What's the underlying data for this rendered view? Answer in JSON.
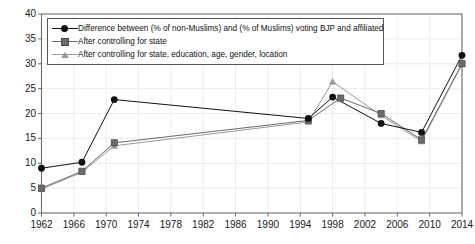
{
  "chart_data": {
    "type": "line",
    "title": "",
    "xlabel": "",
    "ylabel": "",
    "xlim": [
      1962,
      2014
    ],
    "ylim": [
      0,
      40
    ],
    "ytick_step": 5,
    "xtick_step": 4,
    "grid": true,
    "legend_position": "top-left",
    "yticks": [
      "0",
      "5",
      "10",
      "15",
      "20",
      "25",
      "30",
      "35",
      "40"
    ],
    "xticks": [
      "1962",
      "1966",
      "1970",
      "1974",
      "1978",
      "1982",
      "1986",
      "1990",
      "1994",
      "1998",
      "2002",
      "2006",
      "2010",
      "2014"
    ],
    "x": [
      1962,
      1967,
      1971,
      1995,
      1998,
      1999,
      2004,
      2009,
      2014
    ],
    "series": [
      {
        "name": "Difference between (% of non-Muslims) and (% of Muslims) voting BJP and affiliated",
        "marker": "circle",
        "color": "#111111",
        "x": [
          1962,
          1967,
          1971,
          1995,
          1998,
          2004,
          2009,
          2014
        ],
        "values": [
          9.0,
          10.2,
          22.8,
          19.0,
          23.3,
          18.0,
          16.2,
          31.7
        ]
      },
      {
        "name": "After controlling for state",
        "marker": "square",
        "color": "#6b6b6b",
        "x": [
          1962,
          1967,
          1971,
          1995,
          1999,
          2004,
          2009,
          2014
        ],
        "values": [
          5.0,
          8.4,
          14.1,
          18.6,
          23.1,
          20.0,
          14.7,
          30.0
        ]
      },
      {
        "name": "After controlling for state, education, age, gender, location",
        "marker": "triangle",
        "color": "#9a9a9a",
        "x": [
          1962,
          1967,
          1971,
          1995,
          1998,
          2004,
          2009,
          2014
        ],
        "values": [
          4.8,
          8.2,
          13.5,
          18.3,
          26.4,
          19.6,
          14.4,
          29.9
        ]
      }
    ]
  },
  "legend": {
    "items": [
      {
        "label": "Difference between (% of non-Muslims) and (% of Muslims) voting BJP and affiliated",
        "marker": "circle",
        "color": "#111111"
      },
      {
        "label": "After controlling for state",
        "marker": "square",
        "color": "#6b6b6b"
      },
      {
        "label": "After controlling for state, education, age, gender, location",
        "marker": "triangle",
        "color": "#9a9a9a"
      }
    ]
  }
}
